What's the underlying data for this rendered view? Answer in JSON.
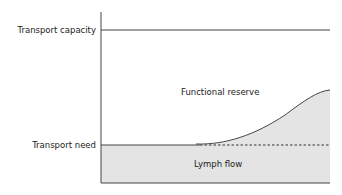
{
  "diagram": {
    "labels": {
      "transport_capacity": "Transport capacity",
      "transport_need": "Transport need",
      "functional_reserve": "Functional reserve",
      "lymph_flow": "Lymph flow"
    },
    "colors": {
      "fill": "#e4e4e4",
      "line": "#444444"
    }
  }
}
